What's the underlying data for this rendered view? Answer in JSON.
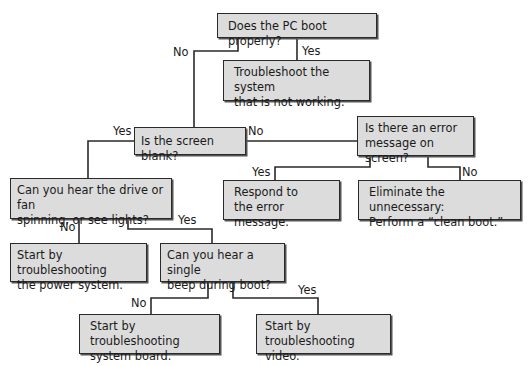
{
  "flowchart": {
    "nodes": {
      "boot": {
        "text": "Does the PC boot properly?"
      },
      "troubleshoot_system": {
        "line1": "Troubleshoot the system",
        "line2": "that is not working."
      },
      "screen_blank": {
        "text": "Is the screen blank?"
      },
      "error_message": {
        "line1": "Is there an error",
        "line2": "message on screen?"
      },
      "respond_error": {
        "line1": "Respond to",
        "line2": "the error message."
      },
      "clean_boot": {
        "line1": "Eliminate the unnecessary:",
        "line2": "Perform a “clean boot.”"
      },
      "hear_drive": {
        "line1": "Can you hear the drive or fan",
        "line2": "spinning, or see lights?"
      },
      "power_system": {
        "line1": "Start by troubleshooting",
        "line2": "the power system."
      },
      "single_beep": {
        "line1": "Can you hear a single",
        "line2": "beep during boot?"
      },
      "system_board": {
        "line1": "Start by troubleshooting",
        "line2": "system board."
      },
      "video": {
        "line1": "Start by",
        "line2": "troubleshooting video."
      }
    },
    "edges": {
      "boot_no": "No",
      "boot_yes": "Yes",
      "blank_yes": "Yes",
      "blank_no": "No",
      "error_yes": "Yes",
      "error_no": "No",
      "drive_no": "No",
      "drive_yes": "Yes",
      "beep_no": "No",
      "beep_yes": "Yes"
    },
    "colors": {
      "box_fill": "#dcdcdc",
      "line": "#2a2a2a"
    }
  }
}
